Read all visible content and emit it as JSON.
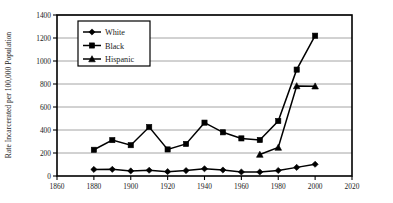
{
  "chart_data": {
    "type": "line",
    "title": "",
    "xlabel": "",
    "ylabel": "Rate Incarcerated per 100,000 Population",
    "xlim": [
      1860,
      2020
    ],
    "ylim": [
      0,
      1400
    ],
    "x_ticks": [
      1860,
      1880,
      1900,
      1920,
      1940,
      1960,
      1980,
      2000,
      2020
    ],
    "y_ticks": [
      0,
      200,
      400,
      600,
      800,
      1000,
      1200,
      1400
    ],
    "grid": "horizontal",
    "legend_position": "upper-left-inside",
    "series": [
      {
        "name": "White",
        "marker": "diamond",
        "x": [
          1880,
          1890,
          1900,
          1910,
          1920,
          1930,
          1940,
          1950,
          1960,
          1970,
          1980,
          1990,
          2000
        ],
        "values": [
          57,
          58,
          44,
          50,
          38,
          47,
          63,
          52,
          35,
          35,
          48,
          75,
          102
        ]
      },
      {
        "name": "Black",
        "marker": "square",
        "x": [
          1880,
          1890,
          1900,
          1910,
          1920,
          1930,
          1940,
          1950,
          1960,
          1970,
          1980,
          1990,
          2000
        ],
        "values": [
          228,
          312,
          268,
          426,
          231,
          279,
          464,
          380,
          327,
          313,
          478,
          925,
          1220
        ]
      },
      {
        "name": "Hispanic",
        "marker": "triangle",
        "x": [
          1970,
          1980,
          1990,
          2000
        ],
        "values": [
          187,
          248,
          783,
          781
        ]
      }
    ]
  },
  "legend": {
    "entries": [
      {
        "label": "White"
      },
      {
        "label": "Black"
      },
      {
        "label": "Hispanic"
      }
    ]
  },
  "axes": {
    "y_title": "Rate Incarcerated per 100,000 Population",
    "y_tick_labels": [
      "0",
      "200",
      "400",
      "600",
      "800",
      "1000",
      "1200",
      "1400"
    ],
    "x_tick_labels": [
      "1860",
      "1880",
      "1900",
      "1920",
      "1940",
      "1960",
      "1980",
      "2000",
      "2020"
    ]
  },
  "colors": {
    "series": "#000000",
    "gridline": "#8e8e8e",
    "frame": "#000000",
    "background": "#ffffff"
  }
}
